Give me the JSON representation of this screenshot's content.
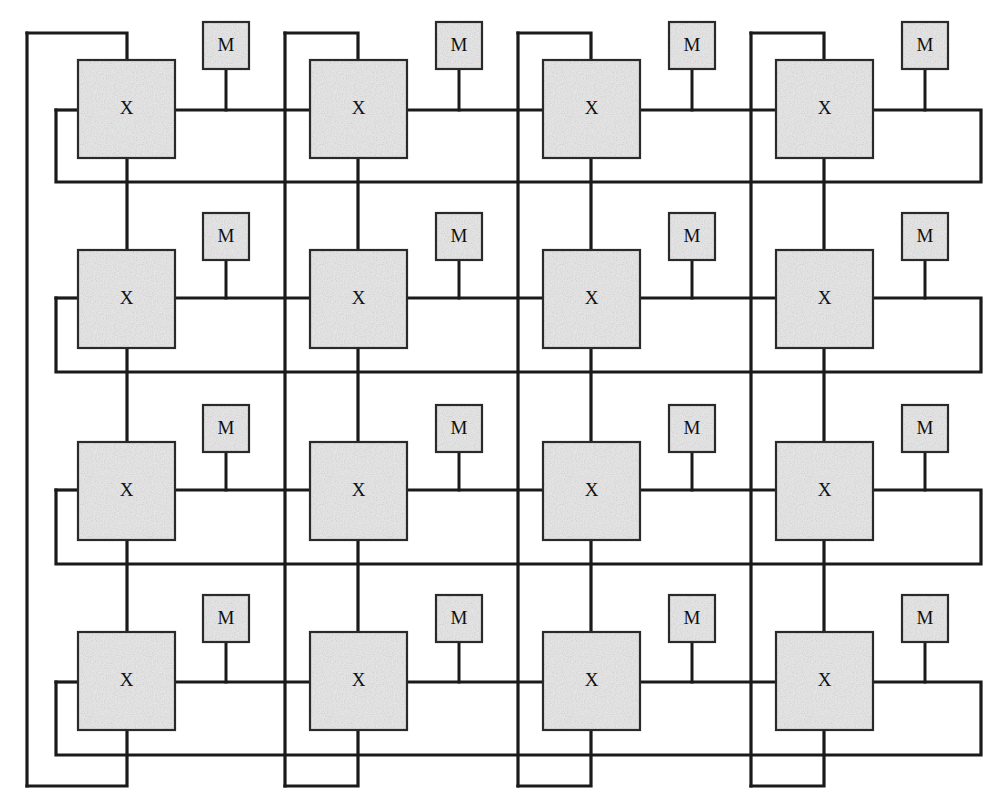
{
  "figure": {
    "line_color": "#1a1a1a",
    "box_fill": "#e6e6e6",
    "box_stroke": "#2a2a2a",
    "background": "#ffffff",
    "width": 999,
    "height": 812
  },
  "legend": {
    "switch_label": "X",
    "memory_label": "M"
  },
  "grid": {
    "rows": 4,
    "cols": 4,
    "switch_count": 16,
    "memory_count": 16
  },
  "switches": [
    {
      "id": "x-r1c1",
      "label": "X",
      "row": 1,
      "col": 1,
      "x": 78,
      "y": 60,
      "w": 97,
      "h": 98
    },
    {
      "id": "x-r1c2",
      "label": "X",
      "row": 1,
      "col": 2,
      "x": 310,
      "y": 60,
      "w": 97,
      "h": 98
    },
    {
      "id": "x-r1c3",
      "label": "X",
      "row": 1,
      "col": 3,
      "x": 543,
      "y": 60,
      "w": 97,
      "h": 98
    },
    {
      "id": "x-r1c4",
      "label": "X",
      "row": 1,
      "col": 4,
      "x": 776,
      "y": 60,
      "w": 97,
      "h": 98
    },
    {
      "id": "x-r2c1",
      "label": "X",
      "row": 2,
      "col": 1,
      "x": 78,
      "y": 250,
      "w": 97,
      "h": 98
    },
    {
      "id": "x-r2c2",
      "label": "X",
      "row": 2,
      "col": 2,
      "x": 310,
      "y": 250,
      "w": 97,
      "h": 98
    },
    {
      "id": "x-r2c3",
      "label": "X",
      "row": 2,
      "col": 3,
      "x": 543,
      "y": 250,
      "w": 97,
      "h": 98
    },
    {
      "id": "x-r2c4",
      "label": "X",
      "row": 2,
      "col": 4,
      "x": 776,
      "y": 250,
      "w": 97,
      "h": 98
    },
    {
      "id": "x-r3c1",
      "label": "X",
      "row": 3,
      "col": 1,
      "x": 78,
      "y": 442,
      "w": 97,
      "h": 98
    },
    {
      "id": "x-r3c2",
      "label": "X",
      "row": 3,
      "col": 2,
      "x": 310,
      "y": 442,
      "w": 97,
      "h": 98
    },
    {
      "id": "x-r3c3",
      "label": "X",
      "row": 3,
      "col": 3,
      "x": 543,
      "y": 442,
      "w": 97,
      "h": 98
    },
    {
      "id": "x-r3c4",
      "label": "X",
      "row": 3,
      "col": 4,
      "x": 776,
      "y": 442,
      "w": 97,
      "h": 98
    },
    {
      "id": "x-r4c1",
      "label": "X",
      "row": 4,
      "col": 1,
      "x": 78,
      "y": 632,
      "w": 97,
      "h": 98
    },
    {
      "id": "x-r4c2",
      "label": "X",
      "row": 4,
      "col": 2,
      "x": 310,
      "y": 632,
      "w": 97,
      "h": 98
    },
    {
      "id": "x-r4c3",
      "label": "X",
      "row": 4,
      "col": 3,
      "x": 543,
      "y": 632,
      "w": 97,
      "h": 98
    },
    {
      "id": "x-r4c4",
      "label": "X",
      "row": 4,
      "col": 4,
      "x": 776,
      "y": 632,
      "w": 97,
      "h": 98
    }
  ],
  "memories": [
    {
      "id": "m-r1c1",
      "label": "M",
      "row": 1,
      "col": 1,
      "x": 203,
      "y": 22,
      "w": 46,
      "h": 47
    },
    {
      "id": "m-r1c2",
      "label": "M",
      "row": 1,
      "col": 2,
      "x": 436,
      "y": 22,
      "w": 46,
      "h": 47
    },
    {
      "id": "m-r1c3",
      "label": "M",
      "row": 1,
      "col": 3,
      "x": 669,
      "y": 22,
      "w": 46,
      "h": 47
    },
    {
      "id": "m-r1c4",
      "label": "M",
      "row": 1,
      "col": 4,
      "x": 902,
      "y": 22,
      "w": 46,
      "h": 47
    },
    {
      "id": "m-r2c1",
      "label": "M",
      "row": 2,
      "col": 1,
      "x": 203,
      "y": 213,
      "w": 46,
      "h": 47
    },
    {
      "id": "m-r2c2",
      "label": "M",
      "row": 2,
      "col": 2,
      "x": 436,
      "y": 213,
      "w": 46,
      "h": 47
    },
    {
      "id": "m-r2c3",
      "label": "M",
      "row": 2,
      "col": 3,
      "x": 669,
      "y": 213,
      "w": 46,
      "h": 47
    },
    {
      "id": "m-r2c4",
      "label": "M",
      "row": 2,
      "col": 4,
      "x": 902,
      "y": 213,
      "w": 46,
      "h": 47
    },
    {
      "id": "m-r3c1",
      "label": "M",
      "row": 3,
      "col": 1,
      "x": 203,
      "y": 405,
      "w": 46,
      "h": 47
    },
    {
      "id": "m-r3c2",
      "label": "M",
      "row": 3,
      "col": 2,
      "x": 436,
      "y": 405,
      "w": 46,
      "h": 47
    },
    {
      "id": "m-r3c3",
      "label": "M",
      "row": 3,
      "col": 3,
      "x": 669,
      "y": 405,
      "w": 46,
      "h": 47
    },
    {
      "id": "m-r3c4",
      "label": "M",
      "row": 3,
      "col": 4,
      "x": 902,
      "y": 405,
      "w": 46,
      "h": 47
    },
    {
      "id": "m-r4c1",
      "label": "M",
      "row": 4,
      "col": 1,
      "x": 203,
      "y": 595,
      "w": 46,
      "h": 47
    },
    {
      "id": "m-r4c2",
      "label": "M",
      "row": 4,
      "col": 2,
      "x": 436,
      "y": 595,
      "w": 46,
      "h": 47
    },
    {
      "id": "m-r4c3",
      "label": "M",
      "row": 4,
      "col": 3,
      "x": 669,
      "y": 595,
      "w": 46,
      "h": 47
    },
    {
      "id": "m-r4c4",
      "label": "M",
      "row": 4,
      "col": 4,
      "x": 902,
      "y": 595,
      "w": 46,
      "h": 47
    }
  ],
  "geometry": {
    "row_bus_y": [
      110,
      298,
      490,
      682
    ],
    "row_return_y": [
      182,
      372,
      564,
      755
    ],
    "col_bus_x": [
      127,
      358,
      591,
      824
    ],
    "col_return_x": [
      56,
      285,
      518,
      751
    ],
    "outer_left_x": 27,
    "outer_right_x": 981,
    "outer_top_y": 33,
    "outer_bottom_y": 786,
    "col_wrap_top_y": [
      33,
      33,
      33,
      33
    ],
    "col_wrap_bottom_y": [
      786,
      786,
      786,
      786
    ]
  },
  "wires": {
    "row_horizontal_bus": "horizontal link spanning each row of switches",
    "row_wraparound": "right edge of each row loops down and back to the row return line on the left",
    "column_vertical_bus": "vertical link spanning each column of switches",
    "column_wraparound": "bottom of each column loops left and back up to the column top",
    "memory_stub": "short vertical stub from each M box down to the row bus"
  }
}
